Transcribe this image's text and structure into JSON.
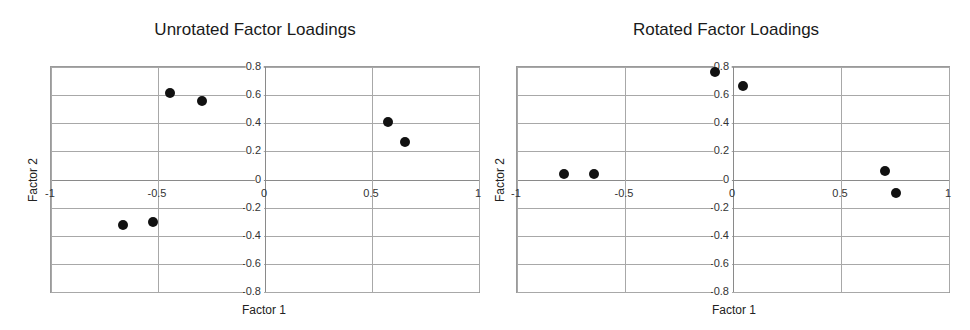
{
  "chart_data": [
    {
      "type": "scatter",
      "title": "Unrotated Factor Loadings",
      "xlabel": "Factor 1",
      "ylabel": "Factor 2",
      "xlim": [
        -1,
        1
      ],
      "ylim": [
        -0.8,
        0.8
      ],
      "x_ticks": [
        -1,
        -0.5,
        0,
        0.5,
        1
      ],
      "x_tick_labels": [
        "-1",
        "-0.5",
        "0",
        "0.5",
        "1"
      ],
      "y_ticks": [
        0.8,
        0.6,
        0.4,
        0.2,
        0,
        -0.2,
        -0.4,
        -0.6,
        -0.8
      ],
      "y_tick_labels": [
        "0.8",
        "0.6",
        "0.4",
        "0.2",
        "0",
        "-0.2",
        "-0.4",
        "-0.6",
        "-0.8"
      ],
      "grid": true,
      "legend": null,
      "points": [
        {
          "x": -0.44,
          "y": 0.61
        },
        {
          "x": -0.29,
          "y": 0.55
        },
        {
          "x": 0.58,
          "y": 0.4
        },
        {
          "x": 0.66,
          "y": 0.26
        },
        {
          "x": -0.66,
          "y": -0.33
        },
        {
          "x": -0.52,
          "y": -0.31
        }
      ]
    },
    {
      "type": "scatter",
      "title": "Rotated Factor Loadings",
      "xlabel": "Factor 1",
      "ylabel": "Factor 2",
      "xlim": [
        -1,
        1
      ],
      "ylim": [
        -0.8,
        0.8
      ],
      "x_ticks": [
        -1,
        -0.5,
        0,
        0.5,
        1
      ],
      "x_tick_labels": [
        "-1",
        "-0.5",
        "0",
        "0.5",
        "1"
      ],
      "y_ticks": [
        0.8,
        0.6,
        0.4,
        0.2,
        0,
        -0.2,
        -0.4,
        -0.6,
        -0.8
      ],
      "y_tick_labels": [
        "0.8",
        "0.6",
        "0.4",
        "0.2",
        "0",
        "-0.2",
        "-0.4",
        "-0.6",
        "-0.8"
      ],
      "grid": true,
      "legend": null,
      "points": [
        {
          "x": -0.08,
          "y": 0.76
        },
        {
          "x": 0.05,
          "y": 0.66
        },
        {
          "x": -0.78,
          "y": 0.03
        },
        {
          "x": -0.64,
          "y": 0.03
        },
        {
          "x": 0.71,
          "y": 0.05
        },
        {
          "x": 0.76,
          "y": -0.1
        }
      ]
    }
  ]
}
